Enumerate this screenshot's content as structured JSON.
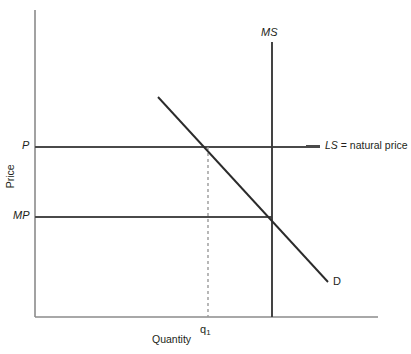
{
  "chart_data": {
    "type": "line",
    "title": "",
    "xlabel": "Quantity",
    "ylabel": "Price",
    "grid": false,
    "legend_position": "right-of-plot",
    "axis_origin_px": [
      35,
      317
    ],
    "series": [
      {
        "name": "D",
        "label": "D",
        "role": "demand-curve",
        "style": "solid",
        "points_px": [
          [
            158,
            97
          ],
          [
            328,
            282
          ]
        ]
      },
      {
        "name": "MS",
        "label": "MS",
        "role": "market-supply-vertical",
        "style": "solid",
        "points_px": [
          [
            272,
            42
          ],
          [
            272,
            317
          ]
        ]
      },
      {
        "name": "LS",
        "label": "LS",
        "role": "long-run-supply-horizontal",
        "style": "solid",
        "points_px": [
          [
            35,
            147
          ],
          [
            320,
            147
          ]
        ]
      },
      {
        "name": "MP",
        "label": "MP",
        "role": "market-price-horizontal",
        "style": "solid",
        "points_px": [
          [
            35,
            217
          ],
          [
            272,
            217
          ]
        ]
      },
      {
        "name": "q1-guide",
        "label": "q1",
        "role": "dashed-guide-vertical",
        "style": "dashed",
        "points_px": [
          [
            208,
            147
          ],
          [
            208,
            317
          ]
        ]
      }
    ],
    "annotations": [
      {
        "name": "ms-label",
        "text": "MS",
        "italic": true
      },
      {
        "name": "d-label",
        "text": "D",
        "italic": false
      },
      {
        "name": "p-label",
        "text": "P",
        "italic": true
      },
      {
        "name": "mp-label",
        "text": "MP",
        "italic": true
      },
      {
        "name": "ls-legend",
        "text": "LS = natural price",
        "italic_part": "LS"
      },
      {
        "name": "q1-tick",
        "text": "q1"
      }
    ],
    "colors": {
      "axis": "#8b8b8b",
      "curve": "#2b2b2b",
      "level": "#4a4a4a",
      "guide": "#9a9a9a",
      "text": "#231f20",
      "background": "#ffffff"
    }
  },
  "axes": {
    "y_title": "Price",
    "x_title": "Quantity"
  },
  "labels": {
    "market_supply": "MS",
    "demand": "D",
    "price_level": "P",
    "market_price": "MP",
    "q1": "q",
    "q1_sub": "1"
  },
  "legend": {
    "symbol": "LS",
    "text": "= natural price"
  }
}
